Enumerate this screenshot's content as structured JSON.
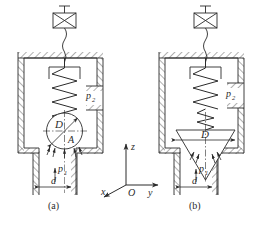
{
  "figure": {
    "type": "engineering-schematic",
    "line_color": "#2b2b2b",
    "hatch_color": "#3a3a3a",
    "background": "#ffffff"
  },
  "diagram_a": {
    "caption": "(a)",
    "valve_type": "ball-poppet",
    "actuator_icon": "solenoid-crossed-box-icon",
    "labels": {
      "diameter": "D",
      "area": "A",
      "inlet_pressure": "p",
      "inlet_pressure_sub": "1",
      "outlet_pressure": "p",
      "outlet_pressure_sub": "2",
      "orifice_diameter": "d"
    }
  },
  "diagram_b": {
    "caption": "(b)",
    "valve_type": "cone-poppet",
    "actuator_icon": "solenoid-crossed-box-icon",
    "labels": {
      "diameter": "D",
      "inlet_pressure": "p",
      "inlet_pressure_sub": "1",
      "outlet_pressure": "p",
      "outlet_pressure_sub": "2",
      "orifice_diameter": "d"
    }
  },
  "axes": {
    "name": "coordinate-system",
    "z": "z",
    "y": "y",
    "x": "x",
    "origin": "O"
  }
}
